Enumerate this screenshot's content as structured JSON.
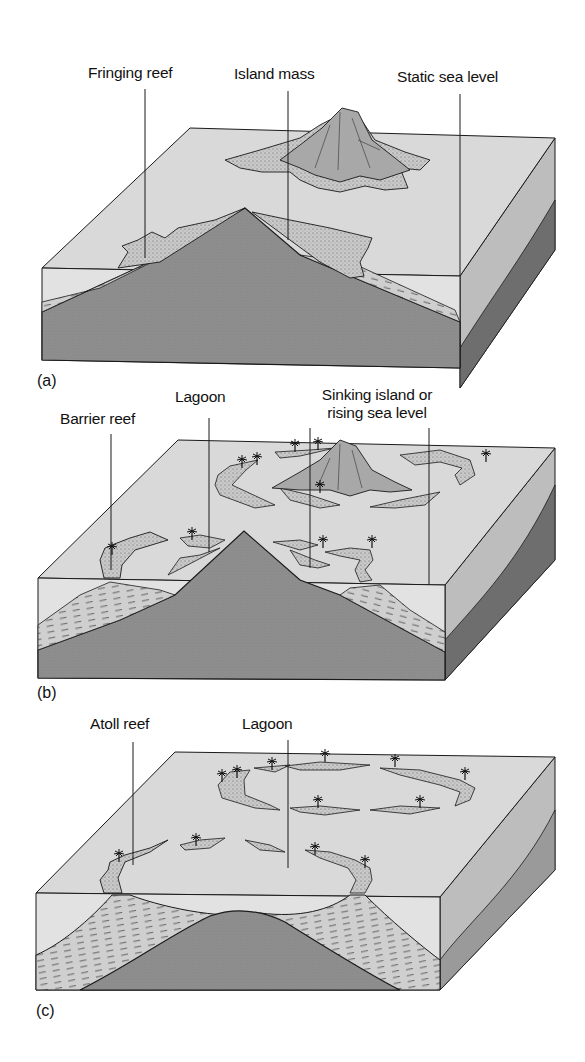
{
  "figure": {
    "colors": {
      "sea_surface": "#d9d9d9",
      "water_front": "#e2e2e2",
      "volcano_rock": "#8c8c8c",
      "reef": "#c8c8c8",
      "side_dark": "#6e6e6e",
      "side_light": "#bdbdbd",
      "outline": "#1a1a1a"
    },
    "panels": [
      {
        "id": "a",
        "letter": "(a)",
        "stage": "fringing-reef",
        "labels": [
          {
            "text": "Fringing reef"
          },
          {
            "text": "Island mass"
          },
          {
            "text": "Static sea level"
          }
        ]
      },
      {
        "id": "b",
        "letter": "(b)",
        "stage": "barrier-reef",
        "labels": [
          {
            "text": "Barrier reef"
          },
          {
            "text": "Lagoon"
          },
          {
            "text": "Sinking island or"
          },
          {
            "text": "rising sea level"
          }
        ]
      },
      {
        "id": "c",
        "letter": "(c)",
        "stage": "atoll",
        "labels": [
          {
            "text": "Atoll reef"
          },
          {
            "text": "Lagoon"
          }
        ]
      }
    ]
  }
}
